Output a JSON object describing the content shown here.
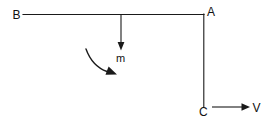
{
  "figure": {
    "canvas": {
      "width": 275,
      "height": 128,
      "background": "#ffffff"
    },
    "ink_color": "#1a1a1a"
  },
  "labels": {
    "point_b": "B",
    "point_a": "A",
    "point_c": "C",
    "mass": "m",
    "velocity": "V"
  },
  "elements": {
    "beam_ba": {
      "name": "horizontal-beam",
      "x1": 23,
      "y1": 14,
      "x2": 204,
      "y2": 14
    },
    "rod_ac": {
      "name": "vertical-rod",
      "x1": 204,
      "y1": 14,
      "x2": 204,
      "y2": 107
    },
    "force_arrow": {
      "name": "downward-force-arrow",
      "x": 121,
      "y_start": 14,
      "y_end": 50
    },
    "rotation_arrow": {
      "name": "rotation-curved-arrow",
      "x_start": 86,
      "y_start": 49,
      "x_end": 116,
      "y_end": 72
    },
    "velocity_arrow": {
      "name": "velocity-arrow",
      "x_start": 212,
      "y": 107,
      "x_end": 250
    }
  },
  "icons": {
    "arrowhead_down": "arrowhead-down-icon",
    "arrowhead_right": "arrowhead-right-icon",
    "arrowhead_curve": "arrowhead-curve-icon"
  }
}
